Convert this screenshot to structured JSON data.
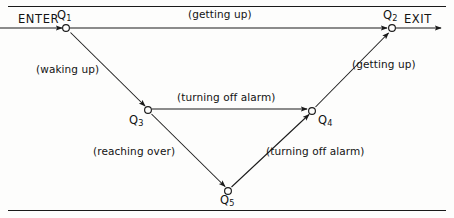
{
  "diagram": {
    "type": "state-transition-diagram",
    "title": "",
    "stroke_color": "#1a1a1a",
    "background_color": "#fdfdfc",
    "terminals": [
      {
        "id": "enter",
        "label": "ENTER",
        "x": 18,
        "y": 19
      },
      {
        "id": "exit",
        "label": "EXIT",
        "x": 404,
        "y": 19
      }
    ],
    "nodes": [
      {
        "id": "q1",
        "base": "Q",
        "sub": "1",
        "cx": 66,
        "cy": 28,
        "label_x": 57,
        "label_y": 8
      },
      {
        "id": "q2",
        "base": "Q",
        "sub": "2",
        "cx": 392,
        "cy": 28,
        "label_x": 383,
        "label_y": 8
      },
      {
        "id": "q3",
        "base": "Q",
        "sub": "3",
        "cx": 148,
        "cy": 110,
        "label_x": 129,
        "label_y": 113
      },
      {
        "id": "q4",
        "base": "Q",
        "sub": "4",
        "cx": 312,
        "cy": 111,
        "label_x": 318,
        "label_y": 113
      },
      {
        "id": "q5",
        "base": "Q",
        "sub": "5",
        "cx": 228,
        "cy": 191,
        "label_x": 220,
        "label_y": 193
      }
    ],
    "edges": [
      {
        "id": "enter-q1",
        "from": "ENTER",
        "to": "Q1",
        "label": "",
        "x1": 0,
        "y1": 28,
        "x2": 62,
        "y2": 28,
        "arrow": true
      },
      {
        "id": "q1-q2",
        "from": "Q1",
        "to": "Q2",
        "label": "(getting up)",
        "x1": 70,
        "y1": 28,
        "x2": 388,
        "y2": 28,
        "arrow": true
      },
      {
        "id": "q1-q3",
        "from": "Q1",
        "to": "Q3",
        "label": "(waking up)",
        "x1": 70,
        "y1": 32,
        "x2": 145,
        "y2": 106,
        "arrow": true
      },
      {
        "id": "q3-q4",
        "from": "Q3",
        "to": "Q4",
        "label": "(turning off alarm)",
        "x1": 152,
        "y1": 109,
        "x2": 308,
        "y2": 109,
        "arrow": true
      },
      {
        "id": "q3-q5",
        "from": "Q3",
        "to": "Q5",
        "label": "(reaching over)",
        "x1": 151,
        "y1": 114,
        "x2": 225,
        "y2": 187,
        "arrow": true
      },
      {
        "id": "q5-q4",
        "from": "Q5",
        "to": "Q4",
        "label": "(turning off alarm)",
        "x1": 231,
        "y1": 187,
        "x2": 309,
        "y2": 114,
        "arrow": true
      },
      {
        "id": "q4-q2",
        "from": "Q4",
        "to": "Q2",
        "label": "(getting up)",
        "x1": 315,
        "y1": 107,
        "x2": 389,
        "y2": 33,
        "arrow": true
      },
      {
        "id": "q2-exit",
        "from": "Q2",
        "to": "EXIT",
        "label": "",
        "x1": 396,
        "y1": 28,
        "x2": 442,
        "y2": 28,
        "arrow": true
      }
    ],
    "edge_labels": [
      {
        "id": "label-getting-up-top",
        "text": "(getting up)",
        "x": 188,
        "y": 8
      },
      {
        "id": "label-waking-up",
        "text": "(waking up)",
        "x": 36,
        "y": 63
      },
      {
        "id": "label-turning-off-alarm-mid",
        "text": "(turning off alarm)",
        "x": 177,
        "y": 91
      },
      {
        "id": "label-getting-up-right",
        "text": "(getting up)",
        "x": 352,
        "y": 58
      },
      {
        "id": "label-reaching-over",
        "text": "(reaching over)",
        "x": 93,
        "y": 145
      },
      {
        "id": "label-turning-off-alarm-low",
        "text": "(turning off alarm)",
        "x": 266,
        "y": 145
      }
    ],
    "rules": [
      {
        "id": "rule-top",
        "y": 6
      },
      {
        "id": "rule-bottom",
        "y": 210
      }
    ]
  }
}
